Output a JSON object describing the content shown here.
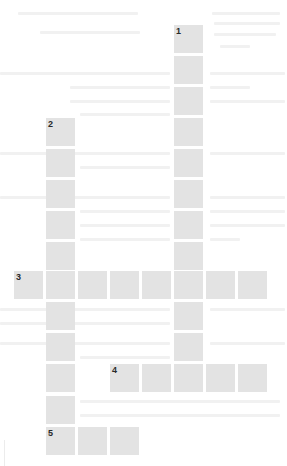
{
  "puzzle": {
    "type": "crossword",
    "cell_color": "#e3e3e3",
    "number_color": "#2a2a2a",
    "background_color": "#ffffff",
    "grid": {
      "origin_x": 14,
      "origin_y": 25,
      "col_pitch": 32,
      "row_pitch": 31.2,
      "cell_width": 29,
      "cell_height": 28
    },
    "entries": [
      {
        "number": "1",
        "direction": "down",
        "row": 0,
        "col": 5,
        "length": 12
      },
      {
        "number": "2",
        "direction": "down",
        "row": 3,
        "col": 1,
        "length": 11
      },
      {
        "number": "3",
        "direction": "across",
        "row": 8,
        "col": 0,
        "length": 8
      },
      {
        "number": "4",
        "direction": "across",
        "row": 11,
        "col": 3,
        "length": 5
      },
      {
        "number": "5",
        "direction": "across",
        "row": 13,
        "col": 1,
        "length": 3
      }
    ],
    "cell_values": ""
  }
}
